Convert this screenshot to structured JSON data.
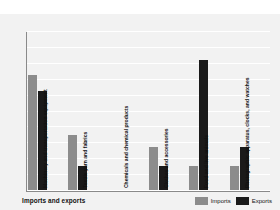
{
  "chart_data": {
    "type": "bar",
    "title": "Imports and exports",
    "xlabel": "",
    "ylabel": "Percentage of total",
    "ylim": [
      0,
      40
    ],
    "yticks": [
      0,
      4,
      8,
      12,
      16,
      20,
      24,
      28,
      32,
      36,
      40
    ],
    "grid": true,
    "legend_position": "bottom-right",
    "categories": [
      "Machinery and transportation equipment",
      "Textile yarn and fabrics",
      "Chemicals and chemical products",
      "Clothes and accessories",
      "Food and live animals",
      "Photographic apparatus, clocks, and watches"
    ],
    "series": [
      {
        "name": "Imports",
        "color": "#8c8c8c",
        "values": [
          29,
          14,
          0,
          11,
          6,
          6
        ]
      },
      {
        "name": "Exports",
        "color": "#1a1a1a",
        "values": [
          25,
          6,
          0,
          6,
          33,
          11
        ]
      }
    ]
  },
  "legend": {
    "items": [
      {
        "label": "Imports"
      },
      {
        "label": "Exports"
      }
    ]
  }
}
